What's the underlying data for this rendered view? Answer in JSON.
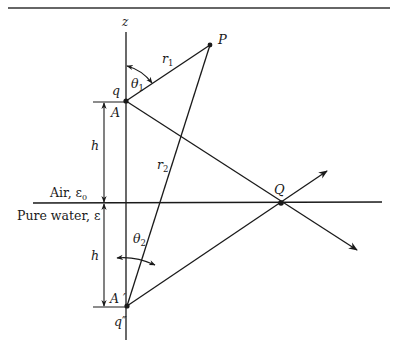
{
  "figure": {
    "type": "image-charge geometry",
    "colors": {
      "ink": "#1a1a1a",
      "background": "#ffffff"
    },
    "labels": {
      "z_axis": "z",
      "point_P": "P",
      "point_Q": "Q",
      "charge_q": "q",
      "charge_q_image": "q″",
      "point_A": "A",
      "point_A_image": "A ′",
      "r1": "r",
      "r1_sub": "1",
      "r2": "r",
      "r2_sub": "2",
      "theta1": "θ",
      "theta1_sub": "1",
      "theta2": "θ",
      "theta2_sub": "2",
      "h_upper": "h",
      "h_lower": "h",
      "air_medium": "Air, ε",
      "air_sub": "0",
      "water_medium": "Pure water, ε"
    }
  }
}
